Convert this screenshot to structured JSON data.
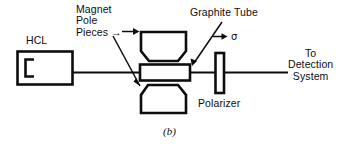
{
  "figure": {
    "caption": "(b)",
    "background_color": "#ffffff",
    "line_color": "#0d0d0d",
    "width": 348,
    "height": 146
  },
  "labels": {
    "magnet_pole_pieces": "Magnet\nPole\nPieces →",
    "graphite_tube": "Graphite Tube",
    "hcl": "HCL",
    "sigma": "→ σ",
    "to_detection_system": "To\nDetection\nSystem",
    "polarizer": "Polarizer"
  },
  "components": [
    {
      "name": "hcl-lamp",
      "label": "HCL"
    },
    {
      "name": "magnet-pole-piece-top",
      "label": "Magnet Pole Pieces"
    },
    {
      "name": "magnet-pole-piece-bottom",
      "label": "Magnet Pole Pieces"
    },
    {
      "name": "graphite-tube",
      "label": "Graphite Tube"
    },
    {
      "name": "polarizer",
      "label": "Polarizer"
    },
    {
      "name": "optical-beam-path",
      "label": ""
    }
  ]
}
